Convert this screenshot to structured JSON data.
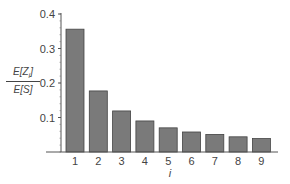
{
  "chart_data": {
    "type": "bar",
    "title": "",
    "xlabel": "i",
    "ylabel": "E[Z_i] / E[S]",
    "ylabel_numerator": "E[Z",
    "ylabel_subscript": "i",
    "ylabel_numerator_close": "]",
    "ylabel_denominator": "E[S]",
    "categories": [
      "1",
      "2",
      "3",
      "4",
      "5",
      "6",
      "7",
      "8",
      "9"
    ],
    "values": [
      0.356,
      0.177,
      0.119,
      0.09,
      0.07,
      0.058,
      0.051,
      0.044,
      0.039
    ],
    "ylim": [
      0,
      0.4
    ],
    "yticks": [
      "0.1",
      "0.2",
      "0.3",
      "0.4"
    ],
    "grid": false,
    "legend": null,
    "bar_color": "#7a7a7a",
    "bar_edge_color": "#444444"
  }
}
